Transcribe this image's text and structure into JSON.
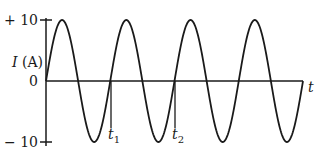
{
  "chart_data": {
    "type": "line",
    "title": "",
    "xlabel": "t",
    "ylabel": "I (A)",
    "ylim": [
      -10,
      10
    ],
    "yticks": [
      "+ 10",
      "0",
      "− 10"
    ],
    "series": [
      {
        "name": "I(t)",
        "function": "10*sin(2*pi*t/T)",
        "cycles": 4,
        "amplitude": 10
      }
    ],
    "annotations": [
      {
        "label": "t",
        "sub": "1",
        "position": "second upward zero crossing"
      },
      {
        "label": "t",
        "sub": "2",
        "position": "third upward zero crossing"
      }
    ],
    "grid": false,
    "legend": "none"
  },
  "labels": {
    "ytick_top": "+ 10",
    "ytick_zero": "0",
    "ytick_bottom": "− 10",
    "ylabel_var": "I",
    "ylabel_unit": " (A)",
    "xlabel": "t",
    "t1": "t",
    "t1_sub": "1",
    "t2": "t",
    "t2_sub": "2"
  },
  "colors": {
    "stroke": "#1a1a1a",
    "background": "#ffffff"
  }
}
